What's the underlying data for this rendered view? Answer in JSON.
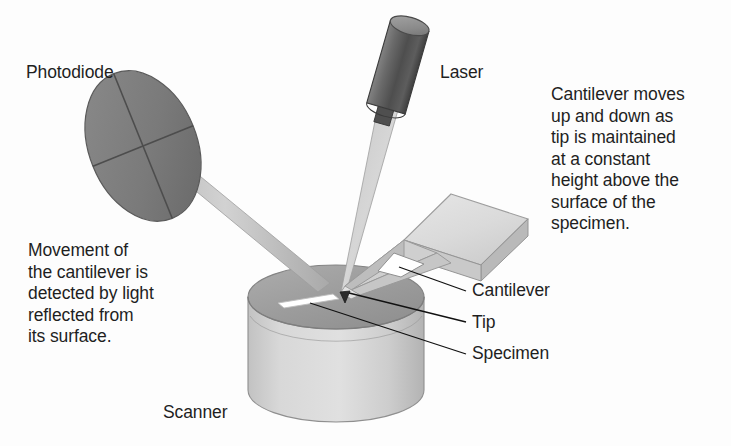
{
  "diagram": {
    "background_color": "#fdfdfd",
    "labels": {
      "photodiode": "Photodiode",
      "laser": "Laser",
      "scanner": "Scanner",
      "cantilever": "Cantilever",
      "tip": "Tip",
      "specimen": "Specimen"
    },
    "annotations": {
      "left": {
        "lines": [
          "Movement of",
          "the cantilever is",
          "detected by light",
          "reflected from",
          "its surface."
        ]
      },
      "right": {
        "lines": [
          "Cantilever moves",
          "up and down as",
          "tip is maintained",
          "at a constant",
          "height above the",
          "surface of the",
          "specimen."
        ]
      }
    },
    "colors": {
      "text": "#1f1f1f",
      "photodiode_fill": "#7b7b7b",
      "photodiode_fill_dark": "#6b6b6b",
      "laser_body": "#5e5e5e",
      "laser_top": "#8f8f8f",
      "beam_light": "#c9c9c9",
      "beam_mid": "#a8a8a8",
      "scanner_top": "#9e9e9e",
      "scanner_body": "#cfcfcf",
      "chip_top": "#dcdcdc",
      "chip_side": "#b4b4b4",
      "specimen": "#ffffff",
      "tip": "#2b2b2b",
      "leader_line": "#111111"
    },
    "parts": [
      "photodiode",
      "laser",
      "laser-beam",
      "reflected-beam",
      "cantilever-chip",
      "cantilever-v-arm",
      "tip",
      "specimen",
      "scanner"
    ]
  }
}
